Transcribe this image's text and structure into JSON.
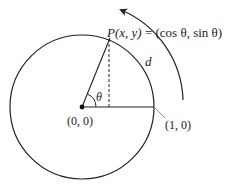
{
  "diagram": {
    "point_label": "P(x, y) = (cos θ, sin θ)",
    "point_label_parts": {
      "p": "P",
      "xy": "(x, y)",
      "eq": " = ",
      "coords": "(cos θ, sin θ)"
    },
    "arc_label": "d",
    "angle_label": "θ",
    "origin_label": "(0, 0)",
    "one_zero_label": "(1, 0)",
    "colors": {
      "stroke": "#222222",
      "leader": "#888888",
      "background": "#ffffff"
    }
  }
}
